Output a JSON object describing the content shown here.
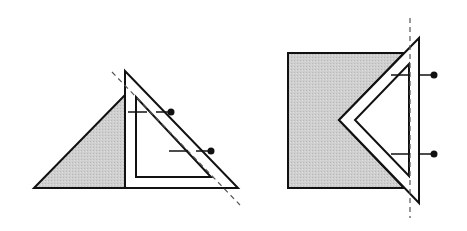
{
  "diagram": {
    "colors": {
      "stroke": "#111111",
      "shade": "#c8c8c8",
      "background": "#ffffff",
      "dash": "#555555"
    },
    "figures": [
      {
        "id": "left",
        "shaded_shape": "triangle",
        "tool": "set-square",
        "pins": 2,
        "guide": "diagonal-dashed"
      },
      {
        "id": "right",
        "shaded_shape": "square",
        "tool": "set-square",
        "pins": 2,
        "guide": "vertical-dashed"
      }
    ]
  }
}
